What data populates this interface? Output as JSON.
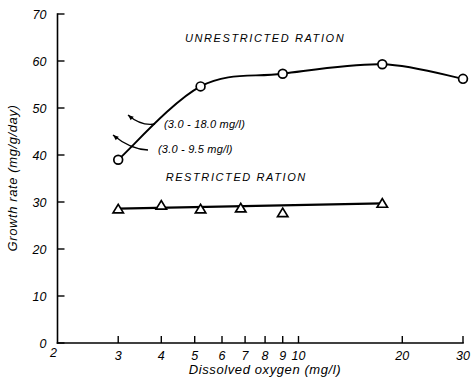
{
  "chart_data": {
    "type": "line",
    "title": "",
    "xlabel": "Dissolved oxygen (mg/l)",
    "ylabel": "Growth rate (mg/g/day)",
    "xscale": "log",
    "xlim": [
      2,
      30
    ],
    "ylim": [
      0,
      70
    ],
    "grid": false,
    "legend_position": "inline-annotation",
    "x_ticks": [
      {
        "value": 2,
        "label": "2"
      },
      {
        "value": 3,
        "label": "3"
      },
      {
        "value": 4,
        "label": "4"
      },
      {
        "value": 5,
        "label": "5"
      },
      {
        "value": 6,
        "label": "6"
      },
      {
        "value": 7,
        "label": "7"
      },
      {
        "value": 8,
        "label": "8"
      },
      {
        "value": 9,
        "label": "9"
      },
      {
        "value": 10,
        "label": "10"
      },
      {
        "value": 20,
        "label": "20"
      },
      {
        "value": 30,
        "label": "30"
      }
    ],
    "y_ticks": [
      {
        "value": 0,
        "label": "0"
      },
      {
        "value": 10,
        "label": "10"
      },
      {
        "value": 20,
        "label": "20"
      },
      {
        "value": 30,
        "label": "30"
      },
      {
        "value": 40,
        "label": "40"
      },
      {
        "value": 50,
        "label": "50"
      },
      {
        "value": 60,
        "label": "60"
      },
      {
        "value": 70,
        "label": "70"
      }
    ],
    "series": [
      {
        "name": "UNRESTRICTED RATION",
        "marker": "open-circle",
        "x": [
          3.0,
          5.2,
          9.0,
          17.5,
          30.0
        ],
        "values": [
          39.0,
          54.6,
          57.3,
          59.3,
          56.2
        ]
      },
      {
        "name": "RESTRICTED RATION",
        "marker": "open-triangle",
        "x": [
          3.0,
          4.0,
          5.2,
          6.8,
          9.0,
          17.5
        ],
        "values": [
          28.6,
          29.4,
          28.6,
          28.8,
          27.8,
          29.8
        ]
      }
    ],
    "annotations": [
      {
        "text": "(3.0 - 18.0 mg/l)",
        "points_to_x": 4.1,
        "points_to_y": 46.5
      },
      {
        "text": "(3.0 - 9.5 mg/l)",
        "points_to_x": 3.6,
        "points_to_y": 43.0
      }
    ],
    "series_labels": [
      {
        "text": "UNRESTRICTED  RATION",
        "x": 8.0,
        "y": 64.0
      },
      {
        "text": "RESTRICTED  RATION",
        "x": 6.6,
        "y": 34.5
      }
    ]
  }
}
